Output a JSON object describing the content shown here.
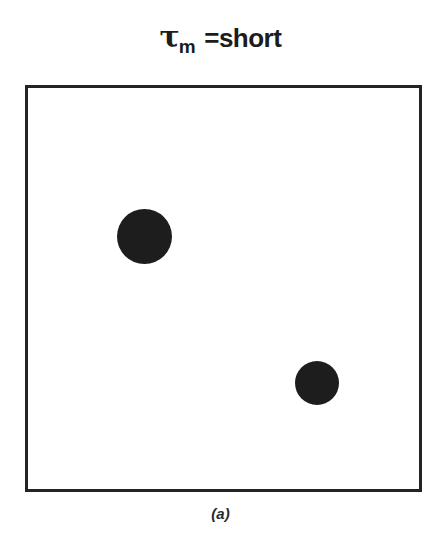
{
  "figure": {
    "title": {
      "symbol": "τ",
      "subscript": "m",
      "relation": "=short",
      "full_text": "τm =short"
    },
    "caption": "(a)",
    "colors": {
      "ink": "#1d1d1d",
      "frame": "#232323",
      "background": "#ffffff"
    },
    "frame": {
      "x": 25,
      "y": 85,
      "width": 397,
      "height": 407,
      "stroke_width": 3
    }
  },
  "chart_data": {
    "type": "scatter",
    "xlabel": "",
    "ylabel": "",
    "xlim": [
      0,
      397
    ],
    "ylim": [
      0,
      407
    ],
    "grid": false,
    "legend": null,
    "annotations": [
      "(a)"
    ],
    "series": [
      {
        "name": "particles",
        "marker": "filled-circle",
        "color": "#1d1d1d",
        "points": [
          {
            "label": "particle-1",
            "x": 89,
            "y": 121,
            "diameter": 55
          },
          {
            "label": "particle-2",
            "x": 267,
            "y": 273,
            "diameter": 44
          }
        ]
      }
    ]
  }
}
